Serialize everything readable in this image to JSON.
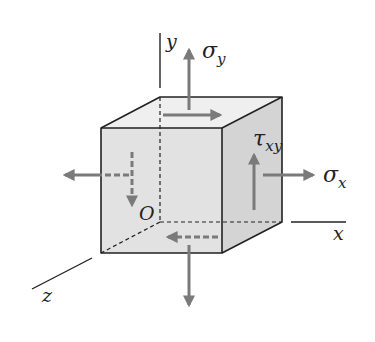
{
  "diagram": {
    "axes": {
      "x": "x",
      "y": "y",
      "z": "z",
      "origin": "O"
    },
    "stresses": {
      "sigma_x": {
        "symbol": "σ",
        "sub": "x"
      },
      "sigma_y": {
        "symbol": "σ",
        "sub": "y"
      },
      "tau_xy": {
        "symbol": "τ",
        "sub": "xy"
      }
    },
    "colors": {
      "arrow": "#7a7a7a",
      "edge": "#222222",
      "front_face": "#e2e2e2",
      "top_face": "#efefef",
      "side_face": "#d2d2d2"
    }
  }
}
